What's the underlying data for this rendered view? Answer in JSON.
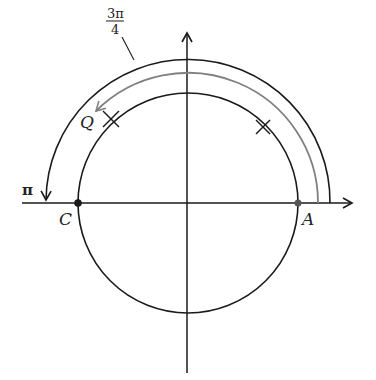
{
  "diagram": {
    "type": "unit-circle-angle",
    "labels": {
      "angle_numerator": "3π",
      "angle_denominator": "4",
      "pi": "π",
      "point_q": "Q",
      "point_c": "C",
      "point_a": "A"
    },
    "colors": {
      "line": "#1a1a1a",
      "gray_arc": "#808080",
      "background": "#ffffff"
    },
    "geometry": {
      "center": [
        188,
        203
      ],
      "circle_radius": 110,
      "gray_arc_radius": 130,
      "outer_arc_radius": 142
    },
    "arcs": [
      {
        "name": "outer-arc-pi",
        "from_angle": 0,
        "to_angle": 180,
        "color": "black",
        "arrow": "end"
      },
      {
        "name": "gray-arc-3pi-4",
        "from_angle": 0,
        "to_angle": 135,
        "color": "gray",
        "arrow": "end"
      }
    ],
    "tick_marks": [
      {
        "name": "tick-q",
        "angle": 135
      },
      {
        "name": "tick-pi-4",
        "angle": 45
      }
    ],
    "points": [
      {
        "name": "A",
        "angle": 0
      },
      {
        "name": "C",
        "angle": 180
      }
    ]
  }
}
